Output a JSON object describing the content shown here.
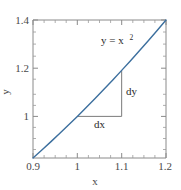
{
  "chart_data": {
    "type": "line",
    "title": "",
    "xlabel": "x",
    "ylabel": "y",
    "xlim": [
      0.9,
      1.2
    ],
    "ylim": [
      0.81,
      1.44
    ],
    "grid": false,
    "legend": null,
    "xticks": [
      0.9,
      1.0,
      1.1,
      1.2
    ],
    "xtick_labels": [
      "0.9",
      "1",
      "1.1",
      "1.2"
    ],
    "xminor_ticks": [
      0.925,
      0.95,
      0.975,
      1.025,
      1.05,
      1.075,
      1.125,
      1.15,
      1.175
    ],
    "yticks": [
      1.0,
      1.2,
      1.4
    ],
    "ytick_labels": [
      "1",
      "1.2",
      "1.4"
    ],
    "yminor_ticks": [
      0.85,
      0.9,
      0.95,
      1.05,
      1.1,
      1.15,
      1.25,
      1.3,
      1.35
    ],
    "series": [
      {
        "name": "y = x^2",
        "color": "#3c6f9e",
        "x": [
          0.9,
          0.92,
          0.94,
          0.96,
          0.98,
          1.0,
          1.02,
          1.04,
          1.06,
          1.08,
          1.1,
          1.12,
          1.14,
          1.16,
          1.18,
          1.2
        ],
        "y": [
          0.81,
          0.8464,
          0.8836,
          0.9216,
          0.9604,
          1.0,
          1.0404,
          1.0816,
          1.1236,
          1.1664,
          1.21,
          1.2544,
          1.2996,
          1.3456,
          1.3924,
          1.44
        ]
      }
    ],
    "annotations": [
      {
        "name": "curve-equation",
        "text": "y = x",
        "superscript": "2",
        "x": 1.06,
        "y": 1.33
      },
      {
        "name": "dy-label",
        "text": "dy",
        "x": 1.112,
        "y": 1.11
      },
      {
        "name": "dx-label",
        "text": "dx",
        "x": 1.042,
        "y": 0.965
      }
    ],
    "triangle": {
      "name": "secant-triangle",
      "color": "#7a7a7a",
      "x0": 1.0,
      "x1": 1.1,
      "y0": 1.0,
      "y1": 1.21,
      "dx_label": "dx",
      "dy_label": "dy"
    },
    "frame": {
      "color": "#8a8a8a",
      "visible_sides": [
        "left",
        "right",
        "top",
        "bottom"
      ]
    }
  },
  "colors": {
    "curve": "#3c6f9e",
    "frame": "#8a8a8a",
    "triangle": "#7a7a7a",
    "tick_text": "#4a4a4a",
    "annotation_text": "#2b2b2b",
    "background": "#ffffff"
  }
}
